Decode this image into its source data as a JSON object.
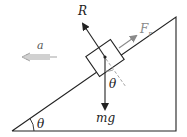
{
  "diagram": {
    "labels": {
      "normal_force": "R",
      "friction_force": "F",
      "friction_subscript": "r",
      "acceleration": "a",
      "weight": "mg",
      "angle_block": "θ",
      "angle_base": "θ"
    },
    "colors": {
      "line": "#222222",
      "friction": "#8a8a8a",
      "acceleration": "#999999",
      "dashed": "#999999"
    }
  }
}
